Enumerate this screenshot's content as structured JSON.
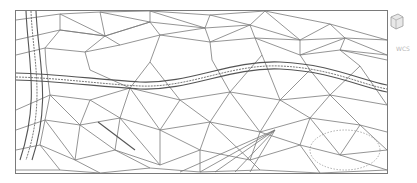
{
  "viewport": {
    "type": "cad-3d-wireframe",
    "description": "Triangulated terrain mesh (TIN) with road corridor"
  },
  "labels": {
    "ucs_label": "WCS"
  },
  "colors": {
    "mesh_line": "#777777",
    "road_line": "#555555",
    "frame": "#7a7a7a",
    "background": "#ffffff",
    "dashed_circle": "#999999"
  }
}
